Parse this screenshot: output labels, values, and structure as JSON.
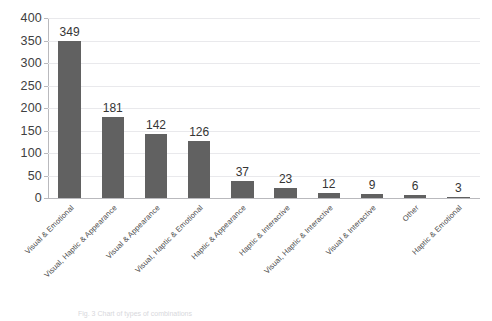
{
  "chart_data": {
    "type": "bar",
    "title": "",
    "xlabel": "",
    "ylabel": "",
    "ylim": [
      0,
      400
    ],
    "ytick_step": 50,
    "yticks": [
      400,
      350,
      300,
      250,
      200,
      150,
      100,
      50,
      0
    ],
    "grid": true,
    "grid_axis": "y",
    "legend": false,
    "bar_color": "#616161",
    "grid_color": "#e9e9ec",
    "axis_color": "#b9b9bd",
    "categories": [
      "Visual & Emotional",
      "Visual, Haptic & Appearance",
      "Visual & Appearance",
      "Visual, Haptic & Emotional",
      "Haptic & Appearance",
      "Haptic & Interactive",
      "Visual, Haptic & Interactive",
      "Visual & Interactive",
      "Other",
      "Haptic & Emotional"
    ],
    "values": [
      349,
      181,
      142,
      126,
      37,
      23,
      12,
      9,
      6,
      3
    ],
    "data_labels": [
      "349",
      "181",
      "142",
      "126",
      "37",
      "23",
      "12",
      "9",
      "6",
      "3"
    ]
  },
  "caption": {
    "text": "Fig. 3 Chart of types of combinations"
  }
}
